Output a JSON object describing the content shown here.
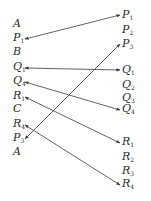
{
  "left_column": [
    {
      "letter": "A",
      "sub": "",
      "y": 25
    },
    {
      "letter": "P",
      "sub": "1",
      "y": 39
    },
    {
      "letter": "B",
      "sub": "",
      "y": 53
    },
    {
      "letter": "Q",
      "sub": "1",
      "y": 68
    },
    {
      "letter": "Q",
      "sub": "4",
      "y": 82
    },
    {
      "letter": "R",
      "sub": "1",
      "y": 97
    },
    {
      "letter": "C",
      "sub": "",
      "y": 110
    },
    {
      "letter": "R",
      "sub": "4",
      "y": 125
    },
    {
      "letter": "P",
      "sub": "3",
      "y": 139
    },
    {
      "letter": "A",
      "sub": "",
      "y": 153
    }
  ],
  "right_column": [
    {
      "letter": "P",
      "sub": "1",
      "y": 16
    },
    {
      "letter": "P",
      "sub": "2",
      "y": 31
    },
    {
      "letter": "P",
      "sub": "3",
      "y": 45
    },
    {
      "letter": "Q",
      "sub": "1",
      "y": 71
    },
    {
      "letter": "Q",
      "sub": "2",
      "y": 86
    },
    {
      "letter": "Q",
      "sub": "3",
      "y": 99
    },
    {
      "letter": "Q",
      "sub": "4",
      "y": 110
    },
    {
      "letter": "R",
      "sub": "1",
      "y": 143
    },
    {
      "letter": "R",
      "sub": "2",
      "y": 158
    },
    {
      "letter": "R",
      "sub": "3",
      "y": 172
    },
    {
      "letter": "R",
      "sub": "4",
      "y": 185
    }
  ],
  "connections": [
    {
      "from": "left.P1",
      "to": "right.P1",
      "x1": 25,
      "y1": 39,
      "x2": 120,
      "y2": 15
    },
    {
      "from": "left.Q1",
      "to": "right.Q1",
      "x1": 25,
      "y1": 68,
      "x2": 120,
      "y2": 70
    },
    {
      "from": "left.Q4",
      "to": "right.Q4",
      "x1": 25,
      "y1": 82,
      "x2": 120,
      "y2": 110
    },
    {
      "from": "left.R1",
      "to": "right.R1",
      "x1": 25,
      "y1": 97,
      "x2": 120,
      "y2": 143
    },
    {
      "from": "left.R4",
      "to": "right.R4",
      "x1": 25,
      "y1": 125,
      "x2": 120,
      "y2": 185
    },
    {
      "from": "left.P3",
      "to": "right.P3",
      "x1": 25,
      "y1": 139,
      "x2": 120,
      "y2": 44
    }
  ],
  "colors": {
    "line": "#3a3a3a",
    "text": "#2a2a2a",
    "background": "#ffffff"
  }
}
